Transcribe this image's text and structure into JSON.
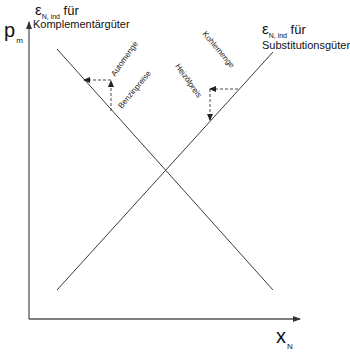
{
  "axes": {
    "y": {
      "symbol": "p",
      "subscript": "m"
    },
    "x": {
      "symbol": "x",
      "subscript": "N"
    }
  },
  "curves": {
    "complements": {
      "epsilon_symbol": "ε",
      "epsilon_subscript": "N, ind",
      "for_word": "für",
      "title": "Komplementärgüter",
      "direction": "falling",
      "quantity_label": "Automenge",
      "price_label": "Benzinpreise"
    },
    "substitutes": {
      "epsilon_symbol": "ε",
      "epsilon_subscript": "N, ind",
      "for_word": "für",
      "title": "Substitutionsgüter",
      "direction": "rising",
      "quantity_label": "Kohlemenge",
      "price_label": "Heizölpreis"
    }
  },
  "colors": {
    "line": "#3a3a3a",
    "axis": "#4a4a4a",
    "text": "#111111"
  }
}
